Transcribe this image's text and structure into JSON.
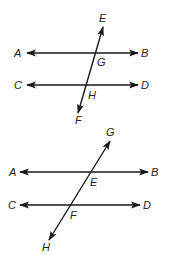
{
  "figures": [
    {
      "name": "figure-1",
      "parallel_lines": [
        {
          "start_label": "A",
          "end_label": "B"
        },
        {
          "start_label": "C",
          "end_label": "D"
        }
      ],
      "transversal": {
        "start_label": "E",
        "end_label": "F"
      },
      "intersections": [
        "G",
        "H"
      ]
    },
    {
      "name": "figure-2",
      "parallel_lines": [
        {
          "start_label": "A",
          "end_label": "B"
        },
        {
          "start_label": "C",
          "end_label": "D"
        }
      ],
      "transversal": {
        "start_label": "G",
        "end_label": "H"
      },
      "intersections": [
        "E",
        "F"
      ]
    }
  ],
  "colors": {
    "line": "#1a1a1a",
    "background": "#ffffff"
  }
}
